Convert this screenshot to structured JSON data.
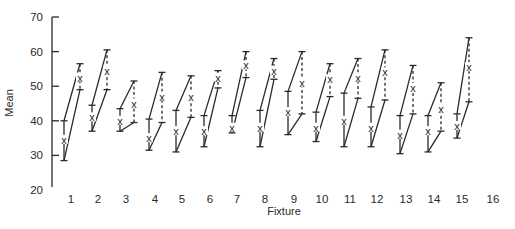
{
  "chart_data": {
    "type": "interval-plot",
    "title": "",
    "xlabel": "Fixture",
    "ylabel": "Mean",
    "ylim": [
      20,
      70
    ],
    "yticks": [
      20,
      30,
      40,
      50,
      60,
      70
    ],
    "categories": [
      "1",
      "2",
      "3",
      "4",
      "5",
      "6",
      "7",
      "8",
      "9",
      "10",
      "11",
      "12",
      "13",
      "14",
      "15",
      "16"
    ],
    "grid": false,
    "legend": null,
    "series": [
      {
        "name": "left interval (solid)",
        "style": "solid",
        "points": [
          {
            "fixture": "1",
            "low": 28.5,
            "mean": 34.5,
            "high": 40.0
          },
          {
            "fixture": "2",
            "low": 37.0,
            "mean": 41.0,
            "high": 44.5
          },
          {
            "fixture": "3",
            "low": 37.0,
            "mean": 40.0,
            "high": 43.5
          },
          {
            "fixture": "4",
            "low": 31.5,
            "mean": 35.0,
            "high": 40.5
          },
          {
            "fixture": "5",
            "low": 31.0,
            "mean": 37.0,
            "high": 43.0
          },
          {
            "fixture": "6",
            "low": 32.5,
            "mean": 37.0,
            "high": 41.5
          },
          {
            "fixture": "7",
            "low": 36.5,
            "mean": 38.0,
            "high": 41.5
          },
          {
            "fixture": "8",
            "low": 32.5,
            "mean": 38.0,
            "high": 43.0
          },
          {
            "fixture": "9",
            "low": 36.0,
            "mean": 42.5,
            "high": 48.5
          },
          {
            "fixture": "10",
            "low": 34.0,
            "mean": 38.0,
            "high": 42.5
          },
          {
            "fixture": "11",
            "low": 32.5,
            "mean": 40.0,
            "high": 48.0
          },
          {
            "fixture": "12",
            "low": 32.5,
            "mean": 38.0,
            "high": 44.0
          },
          {
            "fixture": "13",
            "low": 30.5,
            "mean": 36.0,
            "high": 41.5
          },
          {
            "fixture": "14",
            "low": 31.0,
            "mean": 37.0,
            "high": 41.5
          },
          {
            "fixture": "15",
            "low": 35.0,
            "mean": 38.5,
            "high": 42.0
          }
        ]
      },
      {
        "name": "right interval (dashed)",
        "style": "dashed",
        "points": [
          {
            "fixture": "1",
            "low": 49.0,
            "mean": 52.5,
            "high": 56.5
          },
          {
            "fixture": "2",
            "low": 49.0,
            "mean": 54.5,
            "high": 60.5
          },
          {
            "fixture": "3",
            "low": 39.5,
            "mean": 45.0,
            "high": 51.5
          },
          {
            "fixture": "4",
            "low": 39.5,
            "mean": 47.0,
            "high": 54.0
          },
          {
            "fixture": "5",
            "low": 41.0,
            "mean": 47.0,
            "high": 53.0
          },
          {
            "fixture": "6",
            "low": 49.5,
            "mean": 52.5,
            "high": 54.5
          },
          {
            "fixture": "7",
            "low": 52.5,
            "mean": 56.0,
            "high": 60.0
          },
          {
            "fixture": "8",
            "low": 52.0,
            "mean": 54.5,
            "high": 58.0
          },
          {
            "fixture": "9",
            "low": 42.0,
            "mean": 51.0,
            "high": 60.0
          },
          {
            "fixture": "10",
            "low": 47.0,
            "mean": 52.0,
            "high": 56.5
          },
          {
            "fixture": "11",
            "low": 46.5,
            "mean": 52.5,
            "high": 58.0
          },
          {
            "fixture": "12",
            "low": 46.0,
            "mean": 54.0,
            "high": 60.5
          },
          {
            "fixture": "13",
            "low": 42.0,
            "mean": 49.5,
            "high": 56.0
          },
          {
            "fixture": "14",
            "low": 37.0,
            "mean": 43.5,
            "high": 51.0
          },
          {
            "fixture": "15",
            "low": 45.5,
            "mean": 55.5,
            "high": 64.0
          }
        ]
      }
    ],
    "mean_marker": "x",
    "connectors": "top-to-top and bottom-to-bottom between left and right interval of each fixture"
  },
  "layout": {
    "plot": {
      "axis_x": 52,
      "y_top": 17,
      "y_bottom": 190
    },
    "fixture_label_x": [
      71,
      98,
      126,
      155,
      182,
      210,
      237,
      265,
      294,
      322,
      350,
      377,
      406,
      434,
      462,
      493
    ],
    "left_bar_x": [
      64,
      92,
      120,
      149,
      176,
      204,
      232,
      260,
      288,
      316,
      344,
      371,
      400,
      428,
      457
    ],
    "right_bar_x": [
      80,
      107,
      134,
      162,
      191,
      218,
      246,
      274,
      302,
      330,
      358,
      385,
      413,
      441,
      469
    ]
  }
}
